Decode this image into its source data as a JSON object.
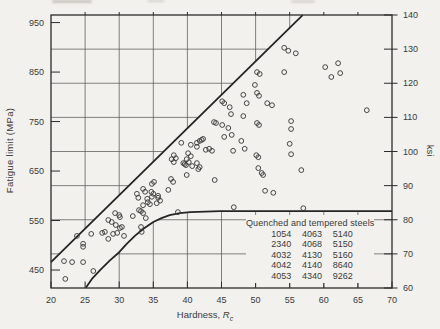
{
  "page": {
    "background": "#f2f1ed",
    "ink": "#3a3a3a",
    "line_color": "#252525",
    "grid_color": "#5a5a5a"
  },
  "chart_data": {
    "type": "scatter",
    "xlabel_prefix": "Hardness, ",
    "xlabel_symbol": "R",
    "xlabel_subscript": "c",
    "ylabel_left": "Fatigue limit (MPa)",
    "ylabel_right": "ksi",
    "x_range": [
      20,
      70
    ],
    "x_ticks": [
      20,
      25,
      30,
      35,
      40,
      45,
      50,
      55,
      60,
      65,
      70
    ],
    "y_left_ticks": [
      450,
      550,
      650,
      750,
      850,
      950
    ],
    "y_right_range": [
      60,
      140
    ],
    "y_right_ticks": [
      60,
      70,
      80,
      90,
      100,
      110,
      120,
      130,
      140
    ],
    "mpa_per_ksi": 6.895,
    "grid": true,
    "legend_position": "bottom-right-inside",
    "upper_line_mpa": [
      [
        20,
        466
      ],
      [
        56.9,
        965
      ]
    ],
    "lower_curve_mpa": [
      [
        25.1,
        414
      ],
      [
        26,
        432
      ],
      [
        27.2,
        450
      ],
      [
        28.6,
        469
      ],
      [
        30,
        486
      ],
      [
        31.1,
        503
      ],
      [
        32.3,
        519
      ],
      [
        33.6,
        534
      ],
      [
        35,
        547
      ],
      [
        36.2,
        555
      ],
      [
        37.4,
        561
      ],
      [
        38.9,
        565
      ],
      [
        40.4,
        567
      ],
      [
        42.6,
        568
      ],
      [
        44.8,
        569
      ],
      [
        70,
        569
      ]
    ],
    "points_rc_mpa": [
      [
        22.1,
        432
      ],
      [
        21.9,
        468
      ],
      [
        23.1,
        466
      ],
      [
        24.7,
        466
      ],
      [
        26.2,
        448
      ],
      [
        23.8,
        519
      ],
      [
        25.9,
        523
      ],
      [
        27.5,
        525
      ],
      [
        27.9,
        527
      ],
      [
        28.4,
        513
      ],
      [
        29.1,
        523
      ],
      [
        29.7,
        525
      ],
      [
        30.7,
        519
      ],
      [
        33.3,
        527
      ],
      [
        24.7,
        503
      ],
      [
        24.7,
        497
      ],
      [
        28.4,
        551
      ],
      [
        28.9,
        547
      ],
      [
        29.4,
        565
      ],
      [
        30,
        561
      ],
      [
        29.5,
        541
      ],
      [
        30.1,
        557
      ],
      [
        30.1,
        535
      ],
      [
        30.4,
        537
      ],
      [
        32,
        559
      ],
      [
        33.5,
        565
      ],
      [
        33.9,
        555
      ],
      [
        32.8,
        596
      ],
      [
        34.1,
        594
      ],
      [
        34.8,
        598
      ],
      [
        33.5,
        581
      ],
      [
        34.5,
        583
      ],
      [
        32.9,
        571
      ],
      [
        33.2,
        569
      ],
      [
        33.2,
        537
      ],
      [
        34.2,
        587
      ],
      [
        34.8,
        624
      ],
      [
        35.1,
        628
      ],
      [
        33.5,
        614
      ],
      [
        33.8,
        608
      ],
      [
        34.7,
        608
      ],
      [
        35,
        604
      ],
      [
        32.6,
        604
      ],
      [
        35.7,
        600
      ],
      [
        35.5,
        585
      ],
      [
        36,
        590
      ],
      [
        35.7,
        596
      ],
      [
        37.2,
        612
      ],
      [
        37.6,
        634
      ],
      [
        37.9,
        628
      ],
      [
        38.6,
        567
      ],
      [
        39.9,
        642
      ],
      [
        39.6,
        664
      ],
      [
        38,
        682
      ],
      [
        38.3,
        676
      ],
      [
        37.7,
        674
      ],
      [
        38,
        668
      ],
      [
        39.1,
        707
      ],
      [
        39.4,
        666
      ],
      [
        39.8,
        662
      ],
      [
        40.1,
        686
      ],
      [
        40.5,
        680
      ],
      [
        39.9,
        674
      ],
      [
        40.2,
        668
      ],
      [
        40.5,
        703
      ],
      [
        41.4,
        707
      ],
      [
        41.8,
        711
      ],
      [
        42.3,
        715
      ],
      [
        41.4,
        699
      ],
      [
        41.6,
        654
      ],
      [
        41.8,
        658
      ],
      [
        42.1,
        713
      ],
      [
        41.4,
        666
      ],
      [
        40.7,
        660
      ],
      [
        42.7,
        693
      ],
      [
        43.2,
        695
      ],
      [
        43.6,
        691
      ],
      [
        43.9,
        749
      ],
      [
        44.2,
        747
      ],
      [
        45.1,
        743
      ],
      [
        45.1,
        791
      ],
      [
        45.4,
        787
      ],
      [
        45.4,
        719
      ],
      [
        46,
        737
      ],
      [
        46.2,
        779
      ],
      [
        46.4,
        765
      ],
      [
        46.5,
        723
      ],
      [
        46.7,
        691
      ],
      [
        46.8,
        577
      ],
      [
        47.9,
        711
      ],
      [
        48.2,
        804
      ],
      [
        48.2,
        761
      ],
      [
        48.4,
        695
      ],
      [
        48.7,
        787
      ],
      [
        44,
        632
      ],
      [
        49.9,
        824
      ],
      [
        50.2,
        850
      ],
      [
        50.6,
        846
      ],
      [
        50.2,
        808
      ],
      [
        50.5,
        802
      ],
      [
        50.1,
        682
      ],
      [
        50.4,
        678
      ],
      [
        50.2,
        747
      ],
      [
        50.5,
        743
      ],
      [
        50.4,
        656
      ],
      [
        50.9,
        646
      ],
      [
        51.1,
        642
      ],
      [
        51.4,
        610
      ],
      [
        51.7,
        787
      ],
      [
        52.4,
        783
      ],
      [
        52.6,
        606
      ],
      [
        54.2,
        850
      ],
      [
        54.2,
        899
      ],
      [
        54.8,
        893
      ],
      [
        55.9,
        888
      ],
      [
        55.2,
        751
      ],
      [
        55.2,
        735
      ],
      [
        55,
        705
      ],
      [
        55.2,
        684
      ],
      [
        56.7,
        652
      ],
      [
        57,
        575
      ],
      [
        60.2,
        860
      ],
      [
        62.1,
        868
      ],
      [
        62.4,
        848
      ],
      [
        61.1,
        840
      ],
      [
        66.3,
        773
      ]
    ],
    "legend": {
      "title": "Quenched and tempered steels",
      "rows": [
        [
          "1054",
          "4063",
          "5140"
        ],
        [
          "2340",
          "4068",
          "5150"
        ],
        [
          "4032",
          "4130",
          "5160"
        ],
        [
          "4042",
          "4140",
          "8640"
        ],
        [
          "4053",
          "4340",
          "9262"
        ]
      ]
    }
  }
}
